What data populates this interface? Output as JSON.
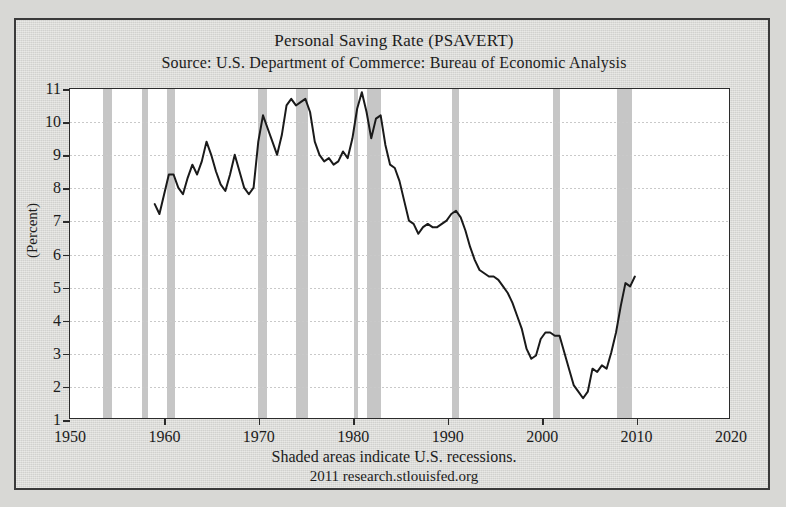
{
  "titles": {
    "main": "Personal Saving Rate (PSAVERT)",
    "source": "Source: U.S. Department of Commerce: Bureau of Economic Analysis"
  },
  "footer": {
    "recession_note": "Shaded areas indicate U.S. recessions.",
    "attribution": "2011 research.stlouisfed.org"
  },
  "colors": {
    "line": "#1a1a1a",
    "recession_band": "#c6c6c6",
    "grid": "#c9c9c9",
    "plot_background": "#ffffff",
    "page_background": "#d8d8d5",
    "frame": "#2b2b2b"
  },
  "chart_data": {
    "type": "line",
    "title": "Personal Saving Rate (PSAVERT)",
    "subtitle": "Source: U.S. Department of Commerce: Bureau of Economic Analysis",
    "xlabel": "",
    "ylabel": "(Percent)",
    "xlim": [
      1950,
      2020
    ],
    "ylim": [
      1,
      11
    ],
    "xticks": [
      1950,
      1960,
      1970,
      1980,
      1990,
      2000,
      2010,
      2020
    ],
    "yticks": [
      1,
      2,
      3,
      4,
      5,
      6,
      7,
      8,
      9,
      10,
      11
    ],
    "grid": "horizontal-dotted",
    "legend": "none",
    "series": [
      {
        "name": "Personal Saving Rate",
        "x": [
          1959.0,
          1959.5,
          1960.0,
          1960.5,
          1961.0,
          1961.5,
          1962.0,
          1962.5,
          1963.0,
          1963.5,
          1964.0,
          1964.5,
          1965.0,
          1965.5,
          1966.0,
          1966.5,
          1967.0,
          1967.5,
          1968.0,
          1968.5,
          1969.0,
          1969.5,
          1970.0,
          1970.5,
          1971.0,
          1971.5,
          1972.0,
          1972.5,
          1973.0,
          1973.5,
          1974.0,
          1974.5,
          1975.0,
          1975.5,
          1976.0,
          1976.5,
          1977.0,
          1977.5,
          1978.0,
          1978.5,
          1979.0,
          1979.5,
          1980.0,
          1980.5,
          1981.0,
          1981.5,
          1982.0,
          1982.5,
          1983.0,
          1983.5,
          1984.0,
          1984.5,
          1985.0,
          1985.5,
          1986.0,
          1986.5,
          1987.0,
          1987.5,
          1988.0,
          1988.5,
          1989.0,
          1989.5,
          1990.0,
          1990.5,
          1991.0,
          1991.5,
          1992.0,
          1992.5,
          1993.0,
          1993.5,
          1994.0,
          1994.5,
          1995.0,
          1995.5,
          1996.0,
          1996.5,
          1997.0,
          1997.5,
          1998.0,
          1998.5,
          1999.0,
          1999.5,
          2000.0,
          2000.5,
          2001.0,
          2001.5,
          2002.0,
          2002.5,
          2003.0,
          2003.5,
          2004.0,
          2004.5,
          2005.0,
          2005.5,
          2006.0,
          2006.5,
          2007.0,
          2007.5,
          2008.0,
          2008.5,
          2009.0,
          2009.5,
          2010.0
        ],
        "y": [
          7.5,
          7.2,
          7.8,
          8.4,
          8.4,
          8.0,
          7.8,
          8.3,
          8.7,
          8.4,
          8.8,
          9.4,
          9.0,
          8.5,
          8.1,
          7.9,
          8.4,
          9.0,
          8.5,
          8.0,
          7.8,
          8.0,
          9.4,
          10.2,
          9.8,
          9.4,
          9.0,
          9.6,
          10.5,
          10.7,
          10.5,
          10.6,
          10.7,
          10.3,
          9.4,
          9.0,
          8.8,
          8.9,
          8.7,
          8.8,
          9.1,
          8.9,
          9.5,
          10.4,
          10.9,
          10.3,
          9.5,
          10.1,
          10.2,
          9.3,
          8.7,
          8.6,
          8.2,
          7.6,
          7.0,
          6.9,
          6.6,
          6.8,
          6.9,
          6.8,
          6.8,
          6.9,
          7.0,
          7.2,
          7.3,
          7.1,
          6.7,
          6.2,
          5.8,
          5.5,
          5.4,
          5.3,
          5.3,
          5.2,
          5.0,
          4.8,
          4.5,
          4.1,
          3.7,
          3.1,
          2.8,
          2.9,
          3.4,
          3.6,
          3.6,
          3.5,
          3.5,
          3.0,
          2.5,
          2.0,
          1.8,
          1.6,
          1.8,
          2.5,
          2.4,
          2.6,
          2.5,
          3.0,
          3.6,
          4.4,
          5.1,
          5.0,
          5.3
        ]
      }
    ],
    "recessions": [
      {
        "start": 1953.5,
        "end": 1954.4
      },
      {
        "start": 1957.6,
        "end": 1958.3
      },
      {
        "start": 1960.3,
        "end": 1961.1
      },
      {
        "start": 1969.9,
        "end": 1970.9
      },
      {
        "start": 1973.9,
        "end": 1975.2
      },
      {
        "start": 1980.1,
        "end": 1980.5
      },
      {
        "start": 1981.5,
        "end": 1982.9
      },
      {
        "start": 1990.5,
        "end": 1991.2
      },
      {
        "start": 2001.2,
        "end": 2001.9
      },
      {
        "start": 2007.9,
        "end": 2009.5
      }
    ]
  }
}
